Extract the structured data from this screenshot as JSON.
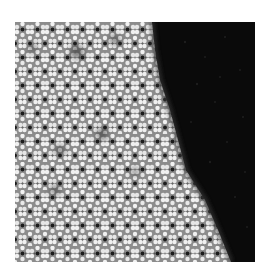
{
  "image": {
    "description": "Grayscale microscopy image of an atomic lattice with a bright quasi-hexagonal honeycomb region on the left and a dark featureless region on the right, separated by a diagonal boundary",
    "frame": {
      "x": 15,
      "y": 22,
      "width": 240,
      "height": 240
    },
    "colors": {
      "background": "#ffffff",
      "lattice_bright": "#e8e8e8",
      "lattice_mid": "#9a9a9a",
      "lattice_dark_dot": "#1a1a1a",
      "dark_region": "#0a0a0a",
      "dark_speckle": "#1c1c1c"
    },
    "lattice": {
      "type": "quasi-hexagonal",
      "period_x_px": 15,
      "period_y_px": 14
    },
    "boundary_points": [
      [
        137,
        0
      ],
      [
        140,
        28
      ],
      [
        145,
        58
      ],
      [
        155,
        88
      ],
      [
        163,
        118
      ],
      [
        171,
        148
      ],
      [
        190,
        178
      ],
      [
        203,
        208
      ],
      [
        216,
        239
      ]
    ],
    "defects": [
      {
        "x": 62,
        "y": 30,
        "r": 7
      },
      {
        "x": 100,
        "y": 18,
        "r": 5
      },
      {
        "x": 18,
        "y": 26,
        "r": 4
      },
      {
        "x": 87,
        "y": 112,
        "r": 6
      },
      {
        "x": 45,
        "y": 128,
        "r": 5
      },
      {
        "x": 40,
        "y": 168,
        "r": 5
      },
      {
        "x": 120,
        "y": 150,
        "r": 4
      }
    ]
  }
}
